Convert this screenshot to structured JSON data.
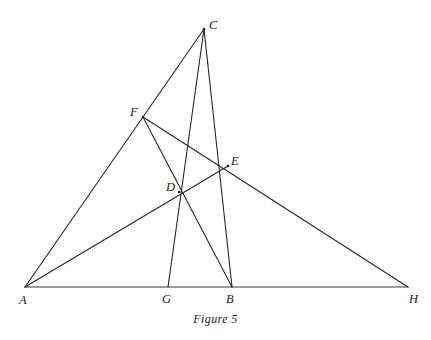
{
  "figure": {
    "caption": "Figure 5",
    "caption_x": 0,
    "caption_y": 312,
    "width": 431,
    "height": 340,
    "background_color": "#ffffff",
    "line_color": "#262626",
    "baseline_color": "#7a7a7a",
    "label_color": "#1a1a1a"
  },
  "points": {
    "A": {
      "label": "A",
      "x": 25,
      "y": 287,
      "label_x": 19,
      "label_y": 294
    },
    "B": {
      "label": "B",
      "x": 232,
      "y": 287,
      "label_x": 226,
      "label_y": 293
    },
    "C": {
      "label": "C",
      "x": 204,
      "y": 29,
      "label_x": 209,
      "label_y": 19
    },
    "D": {
      "label": "D",
      "x": 179,
      "y": 192,
      "label_x": 166,
      "label_y": 181
    },
    "E": {
      "label": "E",
      "x": 228,
      "y": 166,
      "label_x": 231,
      "label_y": 155
    },
    "F": {
      "label": "F",
      "x": 143,
      "y": 117,
      "label_x": 130,
      "label_y": 106
    },
    "G": {
      "label": "G",
      "x": 168,
      "y": 287,
      "label_x": 162,
      "label_y": 293
    },
    "H": {
      "label": "H",
      "x": 408,
      "y": 287,
      "label_x": 409,
      "label_y": 293
    }
  },
  "segments": [
    {
      "name": "segment-A-H-baseline",
      "from": "A",
      "to": "H",
      "style": "baseline"
    },
    {
      "name": "segment-A-C",
      "from": "A",
      "to": "C",
      "style": "normal"
    },
    {
      "name": "segment-A-E",
      "from": "A",
      "to": "E",
      "style": "normal"
    },
    {
      "name": "segment-F-H",
      "from": "F",
      "to": "H",
      "style": "normal"
    },
    {
      "name": "segment-F-B",
      "from": "F",
      "to": "B",
      "style": "normal"
    },
    {
      "name": "segment-C-G",
      "from": "C",
      "to": "G",
      "style": "normal"
    },
    {
      "name": "segment-C-B",
      "from": "C",
      "to": "B",
      "style": "normal"
    }
  ],
  "chart_data": {
    "type": "diagram",
    "title": "Figure 5",
    "vertices": [
      {
        "id": "A",
        "x": 25,
        "y": 287
      },
      {
        "id": "B",
        "x": 232,
        "y": 287
      },
      {
        "id": "C",
        "x": 204,
        "y": 29
      },
      {
        "id": "D",
        "x": 179,
        "y": 192
      },
      {
        "id": "E",
        "x": 228,
        "y": 166
      },
      {
        "id": "F",
        "x": 143,
        "y": 117
      },
      {
        "id": "G",
        "x": 168,
        "y": 287
      },
      {
        "id": "H",
        "x": 408,
        "y": 287
      }
    ],
    "edges": [
      [
        "A",
        "H"
      ],
      [
        "A",
        "C"
      ],
      [
        "A",
        "E"
      ],
      [
        "F",
        "H"
      ],
      [
        "F",
        "B"
      ],
      [
        "C",
        "G"
      ],
      [
        "C",
        "B"
      ]
    ],
    "collinear_notes": [
      "F lies on segment A-C",
      "D lies on segment A-E",
      "E lies on segment F-H",
      "D lies on segment F-B",
      "D lies on segment C-G",
      "E lies on segment C-B",
      "G and B lie on baseline A-H"
    ]
  }
}
